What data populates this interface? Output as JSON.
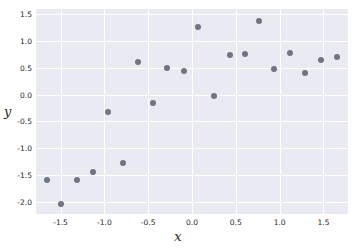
{
  "chart_data": {
    "type": "scatter",
    "title": "",
    "xlabel": "x",
    "ylabel": "y",
    "xlim": [
      -1.78,
      1.78
    ],
    "ylim": [
      -2.23,
      1.6
    ],
    "grid": true,
    "legend": null,
    "xticks": [
      -1.5,
      -1.0,
      -0.5,
      0.0,
      0.5,
      1.0,
      1.5
    ],
    "xticklabels": [
      "-1.5",
      "-1.0",
      "-0.5",
      "0.0",
      "0.5",
      "1.0",
      "1.5"
    ],
    "yticks": [
      1.5,
      1.0,
      0.5,
      0.0,
      -0.5,
      -1.0,
      -1.5,
      -2.0
    ],
    "yticklabels": [
      "1.5",
      "1.0",
      "0.5",
      "0.0",
      "-0.5",
      "-1.0",
      "-1.5",
      "-2.0"
    ],
    "marker_color": "#6f7585",
    "plot_background": "#eaeaf2",
    "grid_color": "#ffffff",
    "points": [
      {
        "x": -1.65,
        "y": -1.59
      },
      {
        "x": -1.5,
        "y": -2.04
      },
      {
        "x": -1.31,
        "y": -1.6
      },
      {
        "x": -1.13,
        "y": -1.44
      },
      {
        "x": -0.96,
        "y": -0.33
      },
      {
        "x": -0.79,
        "y": -1.27
      },
      {
        "x": -0.62,
        "y": 0.61
      },
      {
        "x": -0.45,
        "y": -0.15
      },
      {
        "x": -0.28,
        "y": 0.5
      },
      {
        "x": -0.09,
        "y": 0.44
      },
      {
        "x": 0.07,
        "y": 1.27
      },
      {
        "x": 0.25,
        "y": -0.02
      },
      {
        "x": 0.43,
        "y": 0.75
      },
      {
        "x": 0.6,
        "y": 0.76
      },
      {
        "x": 0.77,
        "y": 1.37
      },
      {
        "x": 0.94,
        "y": 0.47
      },
      {
        "x": 1.12,
        "y": 0.78
      },
      {
        "x": 1.29,
        "y": 0.41
      },
      {
        "x": 1.47,
        "y": 0.65
      },
      {
        "x": 1.65,
        "y": 0.71
      }
    ]
  }
}
